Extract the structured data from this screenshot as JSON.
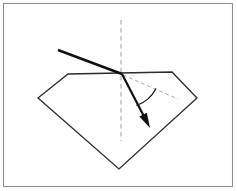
{
  "figure": {
    "background_color": "#ffffff",
    "frame": {
      "name": "outer-border",
      "x": 3.5,
      "y": 3.5,
      "width": 229,
      "height": 183,
      "stroke_color": "#8e8e8e"
    }
  },
  "gem": {
    "label": "diamond-cross-section",
    "stroke_color": "#2b2b2b",
    "fill_color": "#ffffff",
    "points": "68,74 172,72 197,98 119,169 38,98",
    "vertices": [
      {
        "name": "table-left",
        "x": 68,
        "y": 74
      },
      {
        "name": "table-right",
        "x": 172,
        "y": 72
      },
      {
        "name": "girdle-right",
        "x": 197,
        "y": 98
      },
      {
        "name": "culet-bottom",
        "x": 119,
        "y": 169
      },
      {
        "name": "girdle-left",
        "x": 38,
        "y": 98
      }
    ]
  },
  "normal": {
    "label": "surface-normal-dashed",
    "color": "#a8a8a8",
    "x1": 121,
    "y1": 20,
    "x2": 121,
    "y2": 141
  },
  "surface_extension": {
    "label": "reference-dashed-line",
    "color": "#a8a8a8",
    "x1": 123,
    "y1": 75,
    "x2": 178,
    "y2": 99
  },
  "incident_ray": {
    "label": "incident-ray",
    "color": "#111111",
    "x1": 58,
    "y1": 50,
    "x2": 122,
    "y2": 74,
    "stroke_width": 2.6
  },
  "refracted_ray": {
    "label": "refracted-ray",
    "color": "#111111",
    "x1": 122,
    "y1": 74,
    "x2": 150,
    "y2": 128,
    "stroke_width": 2.2,
    "arrow_head": "145.5,115.5 151.5,129.5 139.5,121.5"
  },
  "angle_arc": {
    "label": "refraction-angle-arc",
    "color": "#111111",
    "path": "M 136.5,105.5 A 35,35 0 0 0 156,88.5",
    "radius": 35
  },
  "point_of_incidence": {
    "label": "point-of-incidence",
    "x": 122,
    "y": 74
  }
}
